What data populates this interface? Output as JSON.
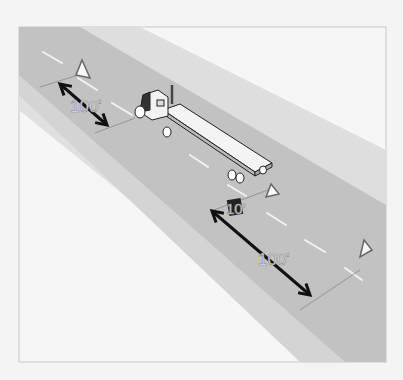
{
  "diagram": {
    "colors": {
      "background": "#f4f4f4",
      "frame_border": "#c8c8c8",
      "road": "#c2c2c2",
      "shoulder": "#d6d6d6",
      "outer_shoulder": "#e2e2e2",
      "lane_marks": "#f2f2f2",
      "arrows": "#111111"
    },
    "labels": {
      "rear_distance": "100'",
      "near_distance": "10'",
      "front_distance": "100'"
    },
    "elements": {
      "vehicle": "flatbed-truck",
      "warning_triangles": 3
    }
  }
}
